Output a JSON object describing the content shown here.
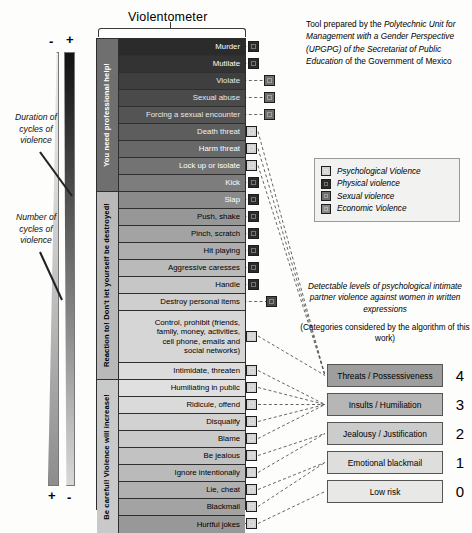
{
  "title": "Violentometer",
  "scale_signs": {
    "minus_top": "-",
    "plus_top": "+",
    "plus_bottom": "+",
    "minus_bottom": "-"
  },
  "annotations": {
    "duration": "Duration of\ncycles of\nviolence",
    "number": "Number of\ncycles of\nviolence"
  },
  "sections": [
    {
      "id": "section-help",
      "label": "You need professional help!",
      "rows": 9,
      "bg": "#6f6f6f",
      "fg": "#ffffff"
    },
    {
      "id": "section-react",
      "label": "Reaction to! Don't let yourself be destroyed!",
      "rows": 9,
      "bg": "#b9b9b9",
      "fg": "#000000"
    },
    {
      "id": "section-careful",
      "label": "Be careful! Violence will increase!",
      "rows": 9,
      "bg": "#c9c9c9",
      "fg": "#000000"
    }
  ],
  "rows": [
    {
      "label": "Murder",
      "bg": "#2b2b2b",
      "fg": "#ffffff",
      "h": 17,
      "marker": "physical"
    },
    {
      "label": "Mutilate",
      "bg": "#333333",
      "fg": "#ffffff",
      "h": 17,
      "marker": "physical"
    },
    {
      "label": "Violate",
      "bg": "#3f3f3f",
      "fg": "#e8e8e8",
      "h": 17,
      "marker": "sexual"
    },
    {
      "label": "Sexual abuse",
      "bg": "#4a4a4a",
      "fg": "#e8e8e8",
      "h": 17,
      "marker": "sexual"
    },
    {
      "label": "Forcing a sexual encounter",
      "bg": "#545454",
      "fg": "#e8e8e8",
      "h": 17,
      "marker": "sexual"
    },
    {
      "label": "Death threat",
      "bg": "#5d5d5d",
      "fg": "#f0f0f0",
      "h": 17,
      "marker": "psychological"
    },
    {
      "label": "Harm threat",
      "bg": "#686868",
      "fg": "#ffffff",
      "h": 17,
      "marker": "psychological"
    },
    {
      "label": "Lock up or isolate",
      "bg": "#737373",
      "fg": "#ffffff",
      "h": 17,
      "marker": "psychological"
    },
    {
      "label": "Kick",
      "bg": "#7d7d7d",
      "fg": "#ffffff",
      "h": 17,
      "marker": "physical"
    },
    {
      "label": "Slap",
      "bg": "#8a8a8a",
      "fg": "#ffffff",
      "h": 17,
      "marker": "physical"
    },
    {
      "label": "Push, shake",
      "bg": "#979797",
      "fg": "#000000",
      "h": 17,
      "marker": "physical"
    },
    {
      "label": "Pinch, scratch",
      "bg": "#a3a3a3",
      "fg": "#000000",
      "h": 17,
      "marker": "physical"
    },
    {
      "label": "Hit playing",
      "bg": "#aeaeae",
      "fg": "#000000",
      "h": 17,
      "marker": "physical"
    },
    {
      "label": "Aggressive caresses",
      "bg": "#bababa",
      "fg": "#000000",
      "h": 17,
      "marker": "physical"
    },
    {
      "label": "Handle",
      "bg": "#c6c6c6",
      "fg": "#000000",
      "h": 17,
      "marker": "physical"
    },
    {
      "label": "Destroy personal items",
      "bg": "#cfcfcf",
      "fg": "#000000",
      "h": 17,
      "marker": "economic"
    },
    {
      "label": "Control, prohibit (friends,\nfamily, money, activities,\ncell phone, emails and\nsocial networks)",
      "bg": "#d6d6d6",
      "fg": "#000000",
      "h": 52,
      "marker": "psychological"
    },
    {
      "label": "Intimidate, threaten",
      "bg": "#dcdcdc",
      "fg": "#000000",
      "h": 17,
      "marker": "psychological"
    },
    {
      "label": "Humiliating in public",
      "bg": "#e0e0e0",
      "fg": "#000000",
      "h": 17,
      "marker": "psychological"
    },
    {
      "label": "Ridicule, offend",
      "bg": "#dadada",
      "fg": "#000000",
      "h": 17,
      "marker": "psychological"
    },
    {
      "label": "Disqualify",
      "bg": "#d2d2d2",
      "fg": "#000000",
      "h": 17,
      "marker": "psychological"
    },
    {
      "label": "Blame",
      "bg": "#cacaca",
      "fg": "#000000",
      "h": 17,
      "marker": "psychological"
    },
    {
      "label": "Be jealous",
      "bg": "#c2c2c2",
      "fg": "#000000",
      "h": 17,
      "marker": "psychological"
    },
    {
      "label": "Ignore intentionally",
      "bg": "#bababa",
      "fg": "#000000",
      "h": 17,
      "marker": "psychological"
    },
    {
      "label": "Lie, cheat",
      "bg": "#b0b0b0",
      "fg": "#000000",
      "h": 17,
      "marker": "psychological"
    },
    {
      "label": "Blackmail",
      "bg": "#a3a3a3",
      "fg": "#000000",
      "h": 17,
      "marker": "psychological"
    },
    {
      "label": "Hurtful jokes",
      "bg": "#989898",
      "fg": "#000000",
      "h": 17,
      "marker": "psychological"
    }
  ],
  "attribution": {
    "line1": "Tool prepared by the ",
    "em1": "Polytechnic Unit for Management with a Gender Perspective (UPGPG)",
    "mid": " of the ",
    "em2": "Secretariat of Public Education",
    "line2": " of the Government of Mexico"
  },
  "legend": {
    "items": [
      {
        "label": "Psychological Violence",
        "color": "#d2d2d2"
      },
      {
        "label": "Physical violence",
        "color": "#2b2b2b"
      },
      {
        "label": "Sexual violence",
        "color": "#6e6e6e"
      },
      {
        "label": "Economic Violence",
        "color": "#8a8a8a"
      }
    ]
  },
  "detect": {
    "heading": "Detectable levels of psychological intimate partner violence against women in written expressions",
    "sub": "(Categories considered by the algorithm of this work)"
  },
  "categories": [
    {
      "label": "Threats / Possessiveness",
      "level": "4",
      "bg": "#9e9e9e"
    },
    {
      "label": "Insults / Humiliation",
      "level": "3",
      "bg": "#b6b6b6"
    },
    {
      "label": "Jealousy / Justification",
      "level": "2",
      "bg": "#cccccc"
    },
    {
      "label": "Emotional blackmail",
      "level": "1",
      "bg": "#dededd"
    },
    {
      "label": "Low risk",
      "level": "0",
      "bg": "#e8e8e6"
    }
  ]
}
